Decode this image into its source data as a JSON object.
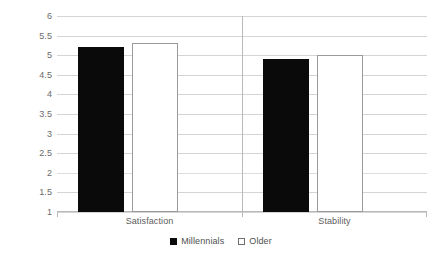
{
  "chart_data": {
    "type": "bar",
    "title": "",
    "subtitle": "",
    "xlabel": "",
    "ylabel": "",
    "categories": [
      "Satisfaction",
      "Stability"
    ],
    "series": [
      {
        "name": "Millennials",
        "values": [
          5.2,
          4.9
        ],
        "color": "#000000",
        "swatch": "filled"
      },
      {
        "name": "Older",
        "values": [
          5.3,
          5.0
        ],
        "color": "#ffffff",
        "swatch": "hollow"
      }
    ],
    "ylim": [
      1,
      6
    ],
    "ytick_labels": [
      "6",
      "5.5",
      "5",
      "4.5",
      "4",
      "3.5",
      "3",
      "2.5",
      "2",
      "1.5",
      "1"
    ],
    "ytick_values": [
      6,
      5.5,
      5,
      4.5,
      4,
      3.5,
      3,
      2.5,
      2,
      1.5,
      1
    ],
    "grid": true,
    "grid_color": "#d4d4d4",
    "legend_position": "bottom",
    "background": "#ffffff"
  },
  "legend": {
    "items": [
      {
        "label": "Millennials"
      },
      {
        "label": "Older"
      }
    ]
  },
  "axis": {
    "category_labels": [
      "Satisfaction",
      "Stability"
    ]
  }
}
